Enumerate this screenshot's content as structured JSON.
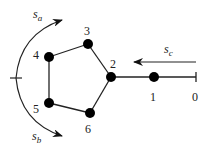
{
  "diagram": {
    "nodes": [
      {
        "id": "0",
        "x": 196,
        "y": 77,
        "type": "tick",
        "label_x": 194,
        "label_y": 96
      },
      {
        "id": "1",
        "x": 154,
        "y": 77,
        "label_x": 150,
        "label_y": 97
      },
      {
        "id": "2",
        "x": 111,
        "y": 77,
        "label_x": 112,
        "label_y": 65
      },
      {
        "id": "3",
        "x": 88,
        "y": 44,
        "label_x": 84,
        "label_y": 31
      },
      {
        "id": "4",
        "x": 49,
        "y": 57,
        "label_x": 33,
        "label_y": 57
      },
      {
        "id": "5",
        "x": 49,
        "y": 103,
        "label_x": 33,
        "label_y": 110
      },
      {
        "id": "6",
        "x": 90,
        "y": 113,
        "label_x": 84,
        "label_y": 133
      }
    ],
    "edges": [
      [
        "0",
        "1"
      ],
      [
        "1",
        "2"
      ],
      [
        "2",
        "3"
      ],
      [
        "3",
        "4"
      ],
      [
        "4",
        "5"
      ],
      [
        "5",
        "6"
      ],
      [
        "6",
        "2"
      ]
    ],
    "arrows": [
      {
        "id": "s_a",
        "label": "s",
        "sub": "a",
        "label_x": 33,
        "label_y": 18
      },
      {
        "id": "s_b",
        "label": "s",
        "sub": "b",
        "label_x": 32,
        "label_y": 140
      },
      {
        "id": "s_c",
        "label": "s",
        "sub": "c",
        "label_x": 164,
        "label_y": 54
      }
    ]
  }
}
